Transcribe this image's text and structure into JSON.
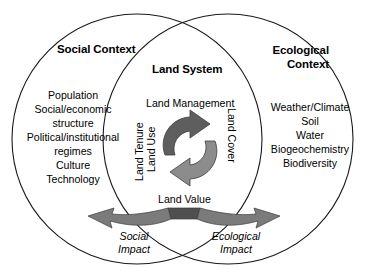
{
  "diagram": {
    "type": "venn-two-circle",
    "left_circle": {
      "heading": "Social Context",
      "items": [
        "Population",
        "Social/economic",
        "structure",
        "Political/institutional",
        "regimes",
        "Culture",
        "Technology"
      ]
    },
    "right_circle": {
      "heading_line1": "Ecological",
      "heading_line2": "Context",
      "items": [
        "Weather/Climate",
        "Soil",
        "Water",
        "Biogeochemistry",
        "Biodiversity"
      ]
    },
    "intersection": {
      "heading": "Land System",
      "top_label": "Land Management",
      "bottom_label": "Land Value",
      "left_vertical_1": "Land Tenure",
      "left_vertical_2": "Land Use",
      "right_vertical": "Land Cover"
    },
    "outputs": {
      "social_impact_line1": "Social",
      "social_impact_line2": "Impact",
      "ecological_impact_line1": "Ecological",
      "ecological_impact_line2": "Impact"
    },
    "colors": {
      "stroke": "#1a1a1a",
      "background": "#ffffff",
      "arrow_dark": "#585858",
      "arrow_mid": "#6e6e6e",
      "arrow_light": "#8f8f8f",
      "text": "#000000"
    }
  }
}
